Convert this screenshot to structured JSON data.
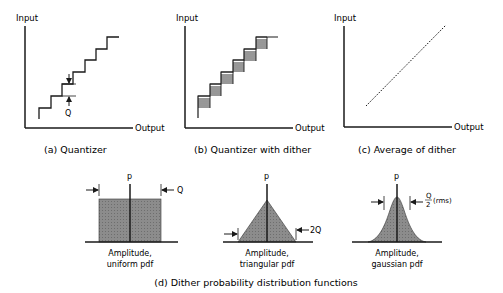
{
  "panels": {
    "a": {
      "caption": "(a) Quantizer",
      "y_axis_label": "Input",
      "x_axis_label": "Output",
      "step_label": "Q"
    },
    "b": {
      "caption": "(b) Quantizer with dither",
      "y_axis_label": "Input",
      "x_axis_label": "Output"
    },
    "c": {
      "caption": "(c) Average of dither",
      "y_axis_label": "Input",
      "x_axis_label": "Output"
    },
    "d": {
      "caption": "(d) Dither probability distribution functions",
      "pdfs": [
        {
          "axis_label": "p",
          "width_label": "Q",
          "caption_line1": "Amplitude,",
          "caption_line2": "uniform pdf"
        },
        {
          "axis_label": "p",
          "width_label": "2Q",
          "caption_line1": "Amplitude,",
          "caption_line2": "triangular pdf"
        },
        {
          "axis_label": "p",
          "width_label_num": "Q",
          "width_label_den": "2",
          "width_label_suffix": "(rms)",
          "caption_line1": "Amplitude,",
          "caption_line2": "gaussian pdf"
        }
      ]
    }
  },
  "colors": {
    "ink": "#1a1a1a",
    "fill": "#8a8a8a"
  }
}
